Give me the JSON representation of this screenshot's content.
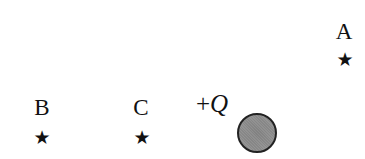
{
  "points": [
    {
      "label": "A",
      "label_x": 344,
      "label_y": 31,
      "star_x": 345,
      "star_y": 59
    },
    {
      "label": "B",
      "label_x": 42,
      "label_y": 107,
      "star_x": 42,
      "star_y": 137
    },
    {
      "label": "C",
      "label_x": 141,
      "label_y": 107,
      "star_x": 142,
      "star_y": 137
    }
  ],
  "star_glyph": "★",
  "charge": {
    "sign": "+",
    "symbol": "Q",
    "label_x": 212,
    "label_y": 103,
    "center_x": 257,
    "center_y": 133,
    "fill": "#909090"
  }
}
